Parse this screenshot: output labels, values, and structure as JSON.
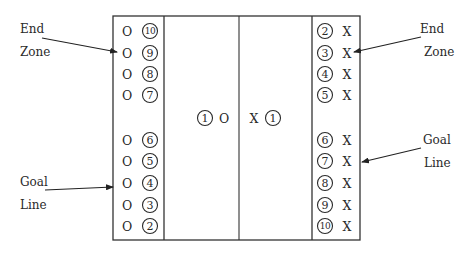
{
  "diagram": {
    "field": {
      "box": {
        "x": 113,
        "y": 16,
        "w": 247,
        "h": 224
      },
      "left_end_zone_line_x": 164,
      "center_line_x": 239,
      "right_end_zone_line_x": 312,
      "line_color": "#333333"
    },
    "left_team": {
      "marker": "O",
      "players": [
        {
          "number": "10",
          "y": 31
        },
        {
          "number": "9",
          "y": 53
        },
        {
          "number": "8",
          "y": 74
        },
        {
          "number": "7",
          "y": 95
        },
        {
          "number": "6",
          "y": 140
        },
        {
          "number": "5",
          "y": 161
        },
        {
          "number": "4",
          "y": 183
        },
        {
          "number": "3",
          "y": 205
        },
        {
          "number": "2",
          "y": 226
        }
      ]
    },
    "right_team": {
      "marker": "X",
      "players": [
        {
          "number": "2",
          "y": 31
        },
        {
          "number": "3",
          "y": 53
        },
        {
          "number": "4",
          "y": 74
        },
        {
          "number": "5",
          "y": 95
        },
        {
          "number": "6",
          "y": 140
        },
        {
          "number": "7",
          "y": 161
        },
        {
          "number": "8",
          "y": 183
        },
        {
          "number": "9",
          "y": 205
        },
        {
          "number": "10",
          "y": 226
        }
      ]
    },
    "center": {
      "left_player": {
        "number": "1",
        "marker": "O"
      },
      "right_player": {
        "number": "1",
        "marker": "X"
      },
      "y": 118
    },
    "annotations": {
      "left_end_zone": {
        "line1": "End",
        "line2": "Zone"
      },
      "left_goal_line": {
        "line1": "Goal",
        "line2": "Line"
      },
      "right_end_zone": {
        "line1": "End",
        "line2": "Zone"
      },
      "right_goal_line": {
        "line1": "Goal",
        "line2": "Line"
      }
    }
  }
}
